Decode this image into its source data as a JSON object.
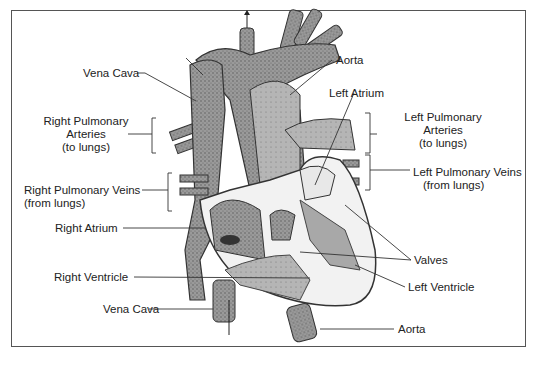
{
  "diagram": {
    "labels": {
      "vena_cava_top": "Vena Cava",
      "aorta_top": "Aorta",
      "left_atrium": "Left Atrium",
      "right_pulmonary_arteries": [
        "Right Pulmonary",
        "Arteries",
        "(to lungs)"
      ],
      "left_pulmonary_arteries": [
        "Left Pulmonary",
        "Arteries",
        "(to lungs)"
      ],
      "right_pulmonary_veins": [
        "Right Pulmonary Veins",
        "(from lungs)"
      ],
      "left_pulmonary_veins": [
        "Left Pulmonary Veins",
        "(from lungs)"
      ],
      "right_atrium": "Right Atrium",
      "valves": "Valves",
      "right_ventricle": "Right Ventricle",
      "left_ventricle": "Left Ventricle",
      "vena_cava_bottom": "Vena Cava",
      "aorta_bottom": "Aorta"
    },
    "colors": {
      "tissue_dark": "#7a7a7a",
      "tissue_mid": "#a8a8a8",
      "tissue_light": "#c9c9c9",
      "line": "#333333",
      "frame": "#555555"
    }
  }
}
